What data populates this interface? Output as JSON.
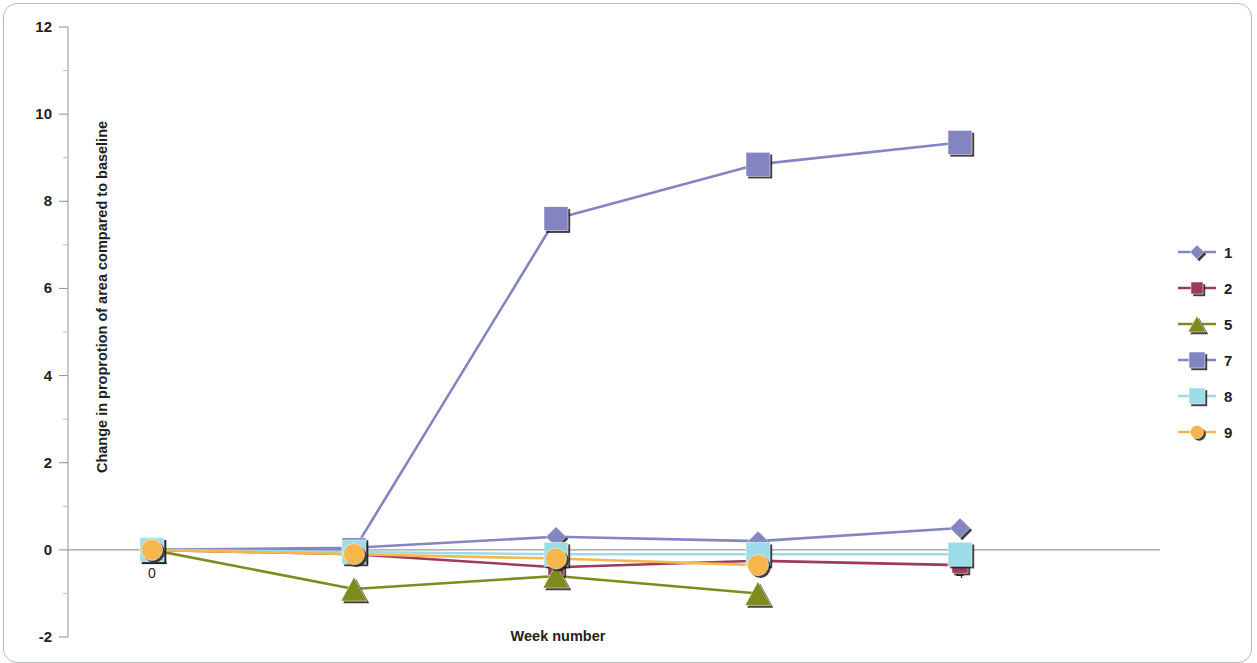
{
  "chart_data": {
    "type": "line",
    "title": "",
    "xlabel": "Week number",
    "ylabel": "Change in proprotion of area compared to baseline",
    "x": [
      0,
      1,
      2,
      3,
      4
    ],
    "xtick_labels": [
      "0",
      "",
      "",
      "",
      "4"
    ],
    "ytick_labels": [
      "12",
      "10",
      "8",
      "6",
      "4",
      "2",
      "0",
      "-2"
    ],
    "ytick_values": [
      12,
      10,
      8,
      6,
      4,
      2,
      0,
      -2
    ],
    "ylim": [
      -2,
      12
    ],
    "xlim": [
      -0.35,
      4.75
    ],
    "grid": false,
    "legend_position": "right",
    "series": [
      {
        "name": "1",
        "label": "1",
        "color": "#8486c0",
        "marker": "diamond",
        "x": [
          0,
          1,
          2,
          3,
          4
        ],
        "values": [
          0.0,
          0.05,
          0.3,
          0.2,
          0.5
        ]
      },
      {
        "name": "2",
        "label": "2",
        "color": "#9e3a5a",
        "marker": "square",
        "x": [
          0,
          1,
          2,
          3,
          4
        ],
        "values": [
          0.0,
          -0.1,
          -0.4,
          -0.25,
          -0.35
        ]
      },
      {
        "name": "5",
        "label": "5",
        "color": "#7d8b1f",
        "marker": "triangle",
        "x": [
          0,
          1,
          2,
          3
        ],
        "values": [
          0.0,
          -0.9,
          -0.6,
          -1.0
        ]
      },
      {
        "name": "7",
        "label": "7",
        "color": "#8285c2",
        "marker": "square",
        "x": [
          0,
          1,
          2,
          3,
          4
        ],
        "values": [
          0.0,
          0.0,
          7.6,
          8.85,
          9.35
        ]
      },
      {
        "name": "8",
        "label": "8",
        "color": "#9bdce8",
        "marker": "square",
        "x": [
          0,
          1,
          2,
          3,
          4
        ],
        "values": [
          0.0,
          -0.05,
          -0.1,
          -0.1,
          -0.1
        ]
      },
      {
        "name": "9",
        "label": "9",
        "color": "#f5b64d",
        "marker": "circle",
        "x": [
          0,
          1,
          2,
          3
        ],
        "values": [
          0.0,
          -0.1,
          -0.2,
          -0.35
        ]
      }
    ]
  }
}
